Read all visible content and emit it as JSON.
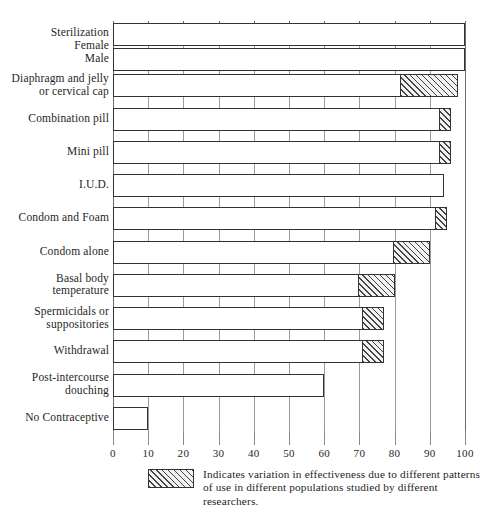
{
  "chart_data": {
    "type": "bar",
    "orientation": "horizontal",
    "title": "",
    "xlabel": "",
    "ylabel": "",
    "xlim": [
      0,
      100
    ],
    "xticks": [
      0,
      10,
      20,
      30,
      40,
      50,
      60,
      70,
      80,
      90,
      100
    ],
    "xtick_labels": [
      "0",
      "10",
      "20",
      "30",
      "40",
      "50",
      "60",
      "70",
      "80",
      "90",
      "100"
    ],
    "grid": true,
    "grid_axis": "x",
    "legend_position": "bottom",
    "categories": [
      "Sterilization\nFemale\nMale",
      "Diaphragm and jelly\nor cervical cap",
      "Combination pill",
      "Mini pill",
      "I.U.D.",
      "Condom and Foam",
      "Condom alone",
      "Basal body\ntemperature",
      "Spermicidals or\nsuppositories",
      "Withdrawal",
      "Post-intercourse\ndouching",
      "No Contraceptive"
    ],
    "bars": [
      {
        "label": "Sterilization Female",
        "category_index": 0,
        "solid_end": 100,
        "hatch_start": null,
        "hatch_end": null,
        "value": 100
      },
      {
        "label": "Sterilization Male",
        "category_index": 0,
        "solid_end": 100,
        "hatch_start": null,
        "hatch_end": null,
        "value": 100
      },
      {
        "label": "Diaphragm and jelly or cervical cap",
        "category_index": 1,
        "solid_end": 82,
        "hatch_start": 82,
        "hatch_end": 98,
        "value": 98
      },
      {
        "label": "Combination pill",
        "category_index": 2,
        "solid_end": 93,
        "hatch_start": 93,
        "hatch_end": 96,
        "value": 96
      },
      {
        "label": "Mini pill",
        "category_index": 3,
        "solid_end": 93,
        "hatch_start": 93,
        "hatch_end": 96,
        "value": 96
      },
      {
        "label": "I.U.D.",
        "category_index": 4,
        "solid_end": 94,
        "hatch_start": null,
        "hatch_end": null,
        "value": 94
      },
      {
        "label": "Condom and Foam",
        "category_index": 5,
        "solid_end": 92,
        "hatch_start": 92,
        "hatch_end": 95,
        "value": 95
      },
      {
        "label": "Condom alone",
        "category_index": 6,
        "solid_end": 80,
        "hatch_start": 80,
        "hatch_end": 90,
        "value": 90
      },
      {
        "label": "Basal body temperature",
        "category_index": 7,
        "solid_end": 70,
        "hatch_start": 70,
        "hatch_end": 80,
        "value": 80
      },
      {
        "label": "Spermicidals or suppositories",
        "category_index": 8,
        "solid_end": 71,
        "hatch_start": 71,
        "hatch_end": 77,
        "value": 77
      },
      {
        "label": "Withdrawal",
        "category_index": 9,
        "solid_end": 71,
        "hatch_start": 71,
        "hatch_end": 77,
        "value": 77
      },
      {
        "label": "Post-intercourse douching",
        "category_index": 10,
        "solid_end": 60,
        "hatch_start": null,
        "hatch_end": null,
        "value": 60
      },
      {
        "label": "No Contraceptive",
        "category_index": 11,
        "solid_end": 10,
        "hatch_start": null,
        "hatch_end": null,
        "value": 10
      }
    ],
    "legend": [
      {
        "swatch": "hatched",
        "text": "Indicates variation in effectiveness due to different patterns\nof use in different populations studied by different researchers."
      }
    ]
  },
  "colors": {
    "bar_fill": "#ffffff",
    "bar_stroke": "#333333",
    "hatch_fill": "#f2f2f2",
    "hatch_stroke": "#444444",
    "gridline": "#9a9a9a",
    "axis": "#4a4a4a",
    "text": "#262626",
    "background": "#ffffff"
  }
}
